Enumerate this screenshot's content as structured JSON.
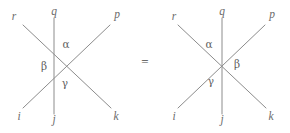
{
  "figure": {
    "line_color": "#8c8c8c",
    "label_color": "#6e6e6e",
    "background": "#ffffff",
    "equals": "=",
    "left_diagram": {
      "name": "left-diagram",
      "endpoint_labels": {
        "top_left": "r",
        "top_middle": "q",
        "top_right": "p",
        "bottom_left": "i",
        "bottom_middle": "j",
        "bottom_right": "k"
      },
      "angle_labels": {
        "upper": "α",
        "left": "β",
        "lower": "γ"
      }
    },
    "right_diagram": {
      "name": "right-diagram",
      "endpoint_labels": {
        "top_left": "r",
        "top_middle": "q",
        "top_right": "p",
        "bottom_left": "i",
        "bottom_middle": "j",
        "bottom_right": "k"
      },
      "angle_labels": {
        "upper": "α",
        "right": "β",
        "lower": "γ"
      }
    }
  }
}
